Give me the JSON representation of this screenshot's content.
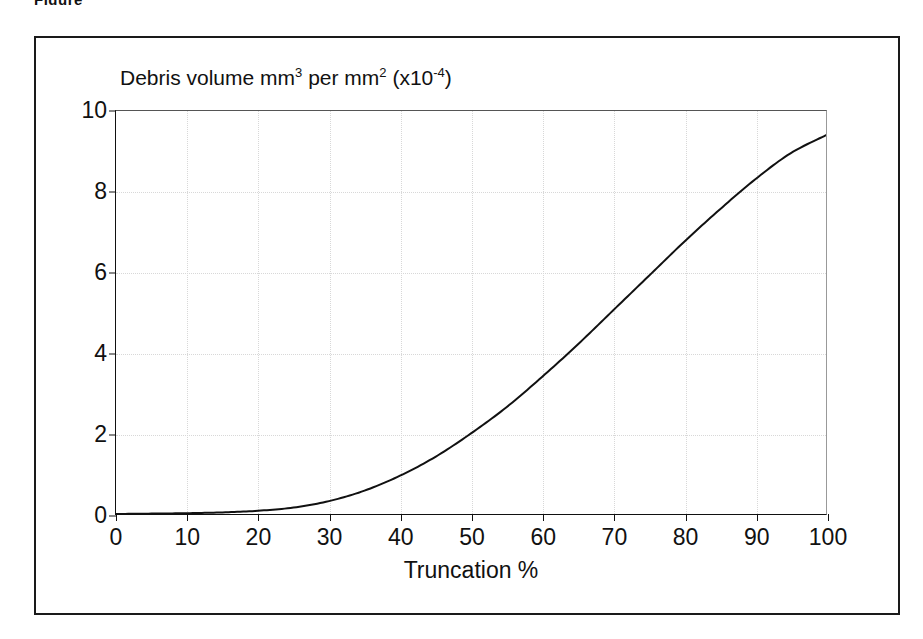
{
  "figure": {
    "caption_fragment": "Figure",
    "frame_color": "#1a1a1a",
    "background": "#ffffff"
  },
  "chart_data": {
    "type": "line",
    "title": "Debris volume mm3 per mm2 (x10-4)",
    "title_parts": {
      "lead": "Debris volume mm",
      "sup1": "3",
      "mid": " per mm",
      "sup2": "2",
      "tail": " (x10",
      "sup3": "-4",
      "close": ")"
    },
    "xlabel": "Truncation %",
    "ylabel": "",
    "xlim": [
      0,
      100
    ],
    "ylim": [
      0,
      10
    ],
    "xticks": [
      0,
      10,
      20,
      30,
      40,
      50,
      60,
      70,
      80,
      90,
      100
    ],
    "yticks": [
      0,
      2,
      4,
      6,
      8,
      10
    ],
    "grid": true,
    "grid_style": "dotted",
    "grid_color": "#d8d8d8",
    "legend": null,
    "line_color": "#111111",
    "line_width": 2,
    "series": [
      {
        "name": "Debris volume",
        "x": [
          0,
          5,
          10,
          15,
          20,
          25,
          30,
          35,
          40,
          45,
          50,
          55,
          60,
          65,
          70,
          75,
          80,
          85,
          90,
          95,
          100
        ],
        "values": [
          0.0,
          0.01,
          0.02,
          0.04,
          0.08,
          0.16,
          0.32,
          0.58,
          0.95,
          1.42,
          2.0,
          2.65,
          3.4,
          4.2,
          5.05,
          5.9,
          6.75,
          7.55,
          8.3,
          8.95,
          9.4
        ]
      }
    ]
  }
}
